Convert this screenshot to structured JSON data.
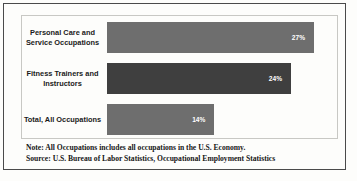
{
  "chart_data": {
    "type": "bar",
    "orientation": "horizontal",
    "title": "",
    "xlabel": "",
    "ylabel": "",
    "grid": false,
    "legend": false,
    "xlim": [
      0,
      30
    ],
    "categories": [
      "Personal Care and Service Occupations",
      "Fitness Trainers and Instructors",
      "Total, All Occupations"
    ],
    "values": [
      27,
      24,
      14
    ],
    "value_labels": [
      "27%",
      "24%",
      "14%"
    ],
    "bar_colors": [
      "#6e6e6e",
      "#3f3f3f",
      "#6e6e6e"
    ]
  },
  "notes": {
    "note_line": "Note: All Occupations includes all occupations in the U.S. Economy.",
    "source_line": "Source: U.S. Bureau of Labor Statistics, Occupational Employment Statistics"
  },
  "style": {
    "outer_border_color": "#4a4a4a",
    "plot_border_color": "#c8c8c4",
    "background": "#fdfdfb",
    "value_text_color": "#ffffff",
    "label_text_color": "#1a1a1a"
  }
}
